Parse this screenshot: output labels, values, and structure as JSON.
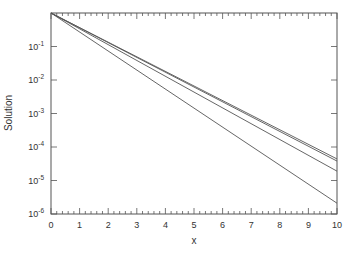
{
  "chart_data": {
    "type": "line",
    "title": "",
    "xlabel": "x",
    "ylabel": "Solution",
    "xlim": [
      0,
      10
    ],
    "ylim": [
      1e-06,
      1
    ],
    "yscale": "log",
    "grid": false,
    "legend": null,
    "x_ticks": [
      "0",
      "1",
      "2",
      "3",
      "4",
      "5",
      "6",
      "7",
      "8",
      "9",
      "10"
    ],
    "y_ticks": [
      {
        "base": "10",
        "exp": "-1",
        "value": 0.1
      },
      {
        "base": "10",
        "exp": "-2",
        "value": 0.01
      },
      {
        "base": "10",
        "exp": "-3",
        "value": 0.001
      },
      {
        "base": "10",
        "exp": "-4",
        "value": 0.0001
      },
      {
        "base": "10",
        "exp": "-5",
        "value": 1e-05
      },
      {
        "base": "10",
        "exp": "-6",
        "value": 1e-06
      }
    ],
    "x": [
      0,
      10
    ],
    "series": [
      {
        "name": "solution-1",
        "values": [
          1.0,
          4.4e-05
        ]
      },
      {
        "name": "solution-2",
        "values": [
          1.0,
          3.8e-05
        ]
      },
      {
        "name": "solution-3",
        "values": [
          1.0,
          1.9e-05
        ]
      },
      {
        "name": "solution-4",
        "values": [
          1.0,
          2.1e-06
        ]
      }
    ],
    "line_color": "#555555"
  }
}
